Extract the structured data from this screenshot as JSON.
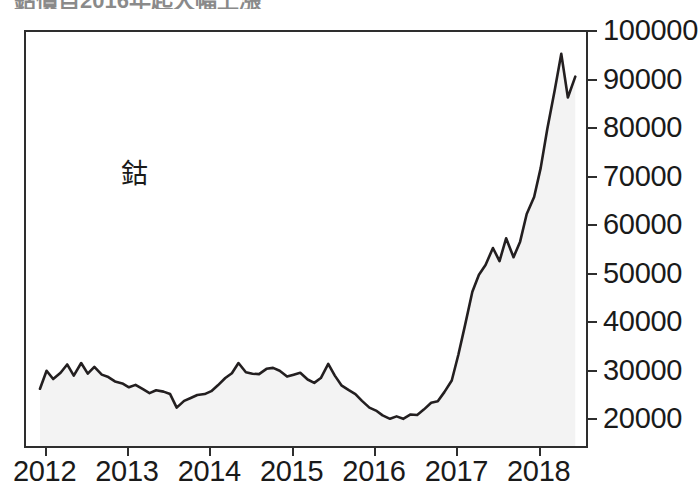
{
  "figure": {
    "title_partial": "鈷價自2016年起大幅上漲",
    "background": "#ffffff",
    "frame_color": "#2e2e2e"
  },
  "chart_data": {
    "type": "area",
    "title": "",
    "series_label": "鈷",
    "xlabel": "",
    "ylabel": "",
    "xlim": [
      2011.75,
      2018.55
    ],
    "ylim": [
      14700,
      100000
    ],
    "grid": false,
    "legend_position": "inside-upper-left",
    "line_color": "#231f20",
    "fill_color": "#f3f3f3",
    "ytick_labels": [
      "100000",
      "90000",
      "80000",
      "70000",
      "60000",
      "50000",
      "40000",
      "30000",
      "20000"
    ],
    "ytick_values": [
      100000,
      90000,
      80000,
      70000,
      60000,
      50000,
      40000,
      30000,
      20000
    ],
    "xtick_labels": [
      "2012",
      "2013",
      "2014",
      "2015",
      "2016",
      "2017",
      "2018"
    ],
    "xtick_values": [
      2012,
      2013,
      2014,
      2015,
      2016,
      2017,
      2018
    ],
    "series": [
      {
        "name": "鈷",
        "x": [
          2011.92,
          2012.0,
          2012.08,
          2012.17,
          2012.25,
          2012.33,
          2012.42,
          2012.5,
          2012.58,
          2012.67,
          2012.75,
          2012.83,
          2012.92,
          2013.0,
          2013.08,
          2013.17,
          2013.25,
          2013.33,
          2013.42,
          2013.5,
          2013.58,
          2013.67,
          2013.75,
          2013.83,
          2013.92,
          2014.0,
          2014.08,
          2014.17,
          2014.25,
          2014.33,
          2014.42,
          2014.5,
          2014.58,
          2014.67,
          2014.75,
          2014.83,
          2014.92,
          2015.0,
          2015.08,
          2015.17,
          2015.25,
          2015.33,
          2015.42,
          2015.5,
          2015.58,
          2015.67,
          2015.75,
          2015.83,
          2015.92,
          2016.0,
          2016.08,
          2016.17,
          2016.25,
          2016.33,
          2016.42,
          2016.5,
          2016.58,
          2016.67,
          2016.75,
          2016.83,
          2016.92,
          2017.0,
          2017.08,
          2017.17,
          2017.25,
          2017.33,
          2017.42,
          2017.5,
          2017.58,
          2017.67,
          2017.75,
          2017.83,
          2017.92,
          2018.0,
          2018.08,
          2018.17,
          2018.25,
          2018.33,
          2018.42
        ],
        "values": [
          26500,
          30200,
          28500,
          29800,
          31500,
          29200,
          31800,
          29600,
          31000,
          29400,
          28900,
          28000,
          27600,
          26800,
          27300,
          26400,
          25600,
          26200,
          25900,
          25400,
          22600,
          24000,
          24600,
          25200,
          25400,
          26000,
          27200,
          28700,
          29700,
          31800,
          29900,
          29600,
          29500,
          30600,
          30800,
          30200,
          29000,
          29400,
          29800,
          28400,
          27700,
          28700,
          31600,
          29200,
          27200,
          26200,
          25400,
          24000,
          22600,
          22000,
          21000,
          20300,
          20800,
          20300,
          21200,
          21100,
          22200,
          23600,
          23900,
          25800,
          28200,
          33500,
          39500,
          46500,
          50000,
          52000,
          55500,
          52800,
          57500,
          53600,
          56800,
          62500,
          66000,
          72000,
          80000,
          88000,
          95500,
          86500,
          90800
        ]
      }
    ],
    "annotations": [
      {
        "text": "鈷",
        "x": 2012.9,
        "y": 80500
      }
    ]
  },
  "axes": {
    "y_ticks": [
      {
        "label": "100000",
        "value": 100000
      },
      {
        "label": "90000",
        "value": 90000
      },
      {
        "label": "80000",
        "value": 80000
      },
      {
        "label": "70000",
        "value": 70000
      },
      {
        "label": "60000",
        "value": 60000
      },
      {
        "label": "50000",
        "value": 50000
      },
      {
        "label": "40000",
        "value": 40000
      },
      {
        "label": "30000",
        "value": 30000
      },
      {
        "label": "20000",
        "value": 20000
      }
    ],
    "x_ticks": [
      {
        "label": "2012",
        "value": 2012
      },
      {
        "label": "2013",
        "value": 2013
      },
      {
        "label": "2014",
        "value": 2014
      },
      {
        "label": "2015",
        "value": 2015
      },
      {
        "label": "2016",
        "value": 2016
      },
      {
        "label": "2017",
        "value": 2017
      },
      {
        "label": "2018",
        "value": 2018
      }
    ]
  }
}
